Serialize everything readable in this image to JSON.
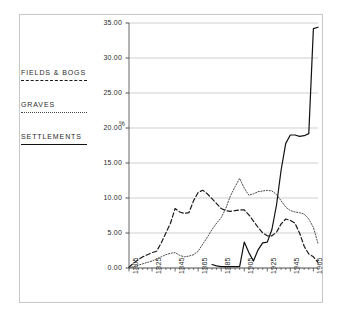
{
  "figure": {
    "frame_color": "#c8c8c8",
    "background": "#ffffff"
  },
  "legend": {
    "position": "left",
    "items": [
      {
        "label": "FIELDS & BOGS",
        "style": "dashed",
        "color": "#1a1a1a"
      },
      {
        "label": "GRAVES",
        "style": "dotted",
        "color": "#4a4a4a"
      },
      {
        "label": "SETTLEMENTS",
        "style": "solid",
        "color": "#111111"
      }
    ]
  },
  "axis": {
    "y_unit_label": "%",
    "y_ticks": [
      "0.00",
      "5.00",
      "10.00",
      "15.00",
      "20.00",
      "25.00",
      "30.00",
      "35.00"
    ],
    "x_ticks": [
      "1805",
      "1825",
      "1845",
      "1865",
      "1885",
      "1905",
      "1925",
      "1945",
      "1965"
    ]
  },
  "chart_data": {
    "type": "line",
    "title": "",
    "xlabel": "",
    "ylabel": "%",
    "xlim": [
      1805,
      1969
    ],
    "ylim": [
      0.0,
      35.0
    ],
    "ytick_values": [
      0.0,
      5.0,
      10.0,
      15.0,
      20.0,
      25.0,
      30.0,
      35.0
    ],
    "xtick_values": [
      1805,
      1825,
      1845,
      1865,
      1885,
      1905,
      1925,
      1945,
      1965
    ],
    "grid": "horizontal",
    "legend_position": "left-outside",
    "series": [
      {
        "name": "FIELDS & BOGS",
        "style": "dashed",
        "color": "#1a1a1a",
        "x": [
          1805,
          1809,
          1813,
          1817,
          1821,
          1825,
          1829,
          1833,
          1837,
          1841,
          1845,
          1849,
          1853,
          1857,
          1861,
          1865,
          1869,
          1873,
          1877,
          1881,
          1885,
          1889,
          1893,
          1897,
          1901,
          1905,
          1909,
          1913,
          1917,
          1921,
          1925,
          1929,
          1933,
          1937,
          1941,
          1945,
          1949,
          1953,
          1957,
          1961,
          1965,
          1969
        ],
        "values": [
          0.1,
          0.7,
          1.2,
          1.6,
          1.9,
          2.2,
          2.4,
          3.6,
          5.0,
          6.4,
          8.5,
          8.0,
          7.8,
          7.9,
          9.6,
          10.8,
          11.1,
          10.6,
          9.9,
          9.2,
          8.5,
          8.2,
          8.1,
          8.2,
          8.3,
          8.3,
          7.6,
          6.7,
          5.8,
          5.0,
          4.6,
          4.6,
          5.1,
          6.3,
          7.0,
          6.8,
          6.4,
          5.0,
          3.1,
          2.0,
          1.6,
          0.8
        ]
      },
      {
        "name": "GRAVES",
        "style": "dotted",
        "color": "#4a4a4a",
        "x": [
          1805,
          1809,
          1813,
          1817,
          1821,
          1825,
          1829,
          1833,
          1837,
          1841,
          1845,
          1849,
          1853,
          1857,
          1861,
          1865,
          1869,
          1873,
          1877,
          1881,
          1885,
          1889,
          1893,
          1897,
          1901,
          1905,
          1909,
          1913,
          1917,
          1921,
          1925,
          1929,
          1933,
          1937,
          1941,
          1945,
          1949,
          1953,
          1957,
          1961,
          1965,
          1969
        ],
        "values": [
          0.0,
          0.2,
          0.4,
          0.6,
          0.8,
          1.0,
          1.3,
          1.6,
          1.9,
          2.1,
          2.2,
          1.8,
          1.6,
          1.7,
          1.9,
          2.4,
          3.4,
          4.4,
          5.5,
          6.4,
          7.2,
          8.5,
          10.3,
          11.6,
          12.8,
          11.4,
          10.4,
          10.6,
          10.9,
          11.0,
          11.1,
          11.0,
          10.5,
          9.6,
          8.7,
          8.2,
          8.0,
          7.9,
          7.7,
          7.0,
          5.8,
          3.5
        ]
      },
      {
        "name": "SETTLEMENTS",
        "style": "solid",
        "color": "#111111",
        "x": [
          1877,
          1881,
          1885,
          1889,
          1893,
          1897,
          1901,
          1905,
          1909,
          1913,
          1917,
          1921,
          1925,
          1929,
          1933,
          1937,
          1941,
          1945,
          1949,
          1953,
          1957,
          1961,
          1965,
          1969
        ],
        "values": [
          0.5,
          0.3,
          0.2,
          0.2,
          0.2,
          0.2,
          0.2,
          3.7,
          2.2,
          1.0,
          2.6,
          3.6,
          3.7,
          5.5,
          9.0,
          14.0,
          17.8,
          19.0,
          19.0,
          18.8,
          18.9,
          19.2,
          34.2,
          34.4
        ]
      }
    ]
  }
}
